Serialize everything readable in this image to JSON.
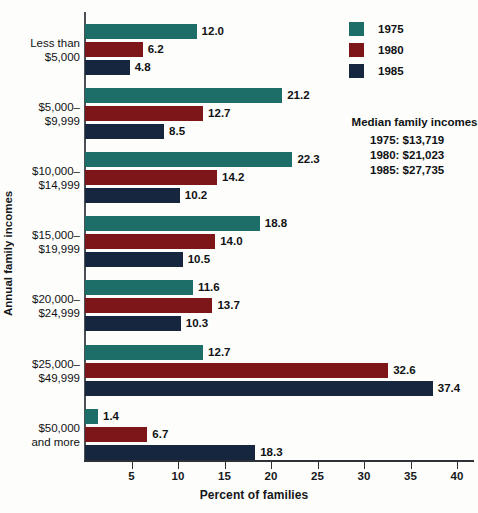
{
  "chart_data": {
    "type": "bar",
    "orientation": "horizontal",
    "title": "",
    "xlabel": "Percent of families",
    "ylabel": "Annual family incomes",
    "xlim": [
      0,
      42
    ],
    "xticks": [
      5,
      10,
      15,
      20,
      25,
      30,
      35,
      40
    ],
    "grid": false,
    "legend_position": "top-right",
    "categories": [
      "Less than\n$5,000",
      "$5,000–\n$9,999",
      "$10,000–\n$14,999",
      "$15,000–\n$19,999",
      "$20,000–\n$24,999",
      "$25,000–\n$49,999",
      "$50,000\nand more"
    ],
    "series": [
      {
        "name": "1975",
        "color": "#1d6d68",
        "values": [
          12.0,
          21.2,
          22.3,
          18.8,
          11.6,
          12.7,
          1.4
        ]
      },
      {
        "name": "1980",
        "color": "#7c1619",
        "values": [
          6.2,
          12.7,
          14.2,
          14.0,
          13.7,
          32.6,
          6.7
        ]
      },
      {
        "name": "1985",
        "color": "#16263f",
        "values": [
          4.8,
          8.5,
          10.2,
          10.5,
          10.3,
          37.4,
          18.3
        ]
      }
    ],
    "value_labels": [
      [
        "12.0",
        "6.2",
        "4.8"
      ],
      [
        "21.2",
        "12.7",
        "8.5"
      ],
      [
        "22.3",
        "14.2",
        "10.2"
      ],
      [
        "18.8",
        "14.0",
        "10.5"
      ],
      [
        "11.6",
        "13.7",
        "10.3"
      ],
      [
        "12.7",
        "32.6",
        "37.4"
      ],
      [
        "1.4",
        "6.7",
        "18.3"
      ]
    ],
    "annotation": {
      "heading": "Median family incomes",
      "rows": [
        "1975: $13,719",
        "1980: $21,023",
        "1985: $27,735"
      ]
    }
  }
}
